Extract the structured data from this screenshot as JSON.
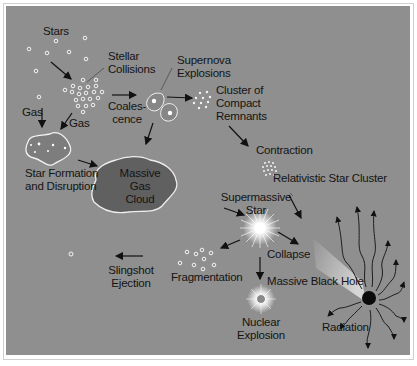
{
  "diagram": {
    "background_color": "#8f8f8f",
    "labels": {
      "stars": "Stars",
      "stellar_collisions": [
        "Stellar",
        "Collisions"
      ],
      "supernova_explosions": [
        "Supernova",
        "Explosions"
      ],
      "cluster_compact_remnants": [
        "Cluster of",
        "Compact",
        "Remnants"
      ],
      "coalescence": [
        "Coales-",
        "cence"
      ],
      "gas_left": "Gas",
      "gas_right": "Gas",
      "star_formation": [
        "Star Formation",
        "and Disruption"
      ],
      "massive_gas_cloud": [
        "Massive",
        "Gas",
        "Cloud"
      ],
      "contraction": "Contraction",
      "relativistic_star_cluster": "Relativistic Star Cluster",
      "supermassive_star": [
        "Supermassive",
        "Star"
      ],
      "collapse": "Collapse",
      "fragmentation": "Fragmentation",
      "slingshot_ejection": [
        "Slingshot",
        "Ejection"
      ],
      "massive_black_hole": "Massive Black Hole",
      "nuclear_explosion": [
        "Nuclear",
        "Explosion"
      ],
      "radiation": "Radiation"
    }
  }
}
